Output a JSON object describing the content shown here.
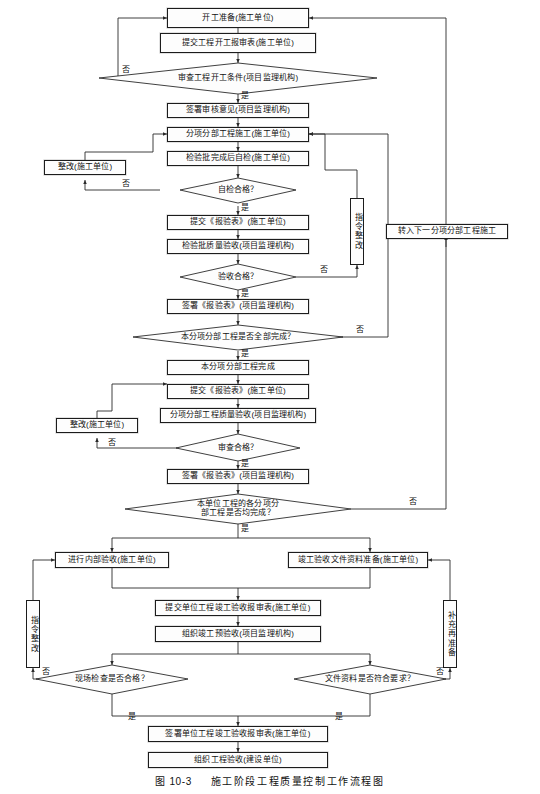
{
  "figure": {
    "caption_label": "图 10-3",
    "caption_title": "施工阶段工程质量控制工作流程图"
  },
  "nodes": {
    "n1": {
      "text": "开工准备(施工单位)"
    },
    "n2": {
      "text": "提交工程开工报审表(施工单位)"
    },
    "d1": {
      "text": "审查工程开工条件(项目监理机构)"
    },
    "n3": {
      "text": "签署审核意见(项目监理机构)"
    },
    "n4": {
      "text": "分项分部工程施工(施工单位)"
    },
    "n5": {
      "text": "检验批完成后自检(施工单位)"
    },
    "r1": {
      "text": "整改(施工单位)"
    },
    "d2": {
      "text": "自检合格？"
    },
    "n6": {
      "text": "提交《报验表》(施工单位)"
    },
    "n7": {
      "text": "检验批质量验收(项目监理机构)"
    },
    "v1": {
      "text": "指令整改"
    },
    "d3": {
      "text": "验收合格？"
    },
    "n8": {
      "text": "签署《报验表》(项目监理机构)"
    },
    "d4": {
      "text": "本分项分部工程是否全部完成？"
    },
    "n9": {
      "text": "转入下一分项分部工程施工"
    },
    "n10": {
      "text": "本分项分部工程完成"
    },
    "n11": {
      "text": "提交《报验表》(施工单位)"
    },
    "n12": {
      "text": "分项分部工程质量验收(项目监理机构)"
    },
    "r2": {
      "text": "整改(施工单位)"
    },
    "d5": {
      "text": "审查合格？"
    },
    "n13": {
      "text": "签署《报验表》(项目监理机构)"
    },
    "d6": {
      "line1": "本单位工程的各分项分",
      "line2": "部工程是否均完成？"
    },
    "n14": {
      "text": "进行内部验收(施工单位)"
    },
    "n15": {
      "text": "竣工验收文件资料准备(施工单位)"
    },
    "v2": {
      "text": "指令整改"
    },
    "v3": {
      "text": "补充再准备"
    },
    "n16": {
      "text": "提交单位工程竣工验收报审表(施工单位)"
    },
    "n17": {
      "text": "组织竣工预验收(项目监理机构)"
    },
    "d7": {
      "text": "现场检查是否合格？"
    },
    "d8": {
      "text": "文件资料是否符合要求？"
    },
    "n18": {
      "text": "签署单位工程竣工验收报审表(施工单位)"
    },
    "n19": {
      "text": "组织工程验收(建设单位)"
    }
  },
  "edge_labels": {
    "no_1": "否",
    "yes_1": "是",
    "no_2": "否",
    "yes_2": "是",
    "no_3": "否",
    "yes_3": "是",
    "no_4": "否",
    "yes_4": "是",
    "no_5": "否",
    "yes_5": "是",
    "no_6": "否",
    "yes_6": "是",
    "no_7": "否",
    "yes_7": "是",
    "no_8": "否",
    "yes_8": "是"
  },
  "colors": {
    "stroke": "#2a2a2a",
    "fill": "#fdfdfd",
    "text": "#111111",
    "background": "#ffffff"
  }
}
